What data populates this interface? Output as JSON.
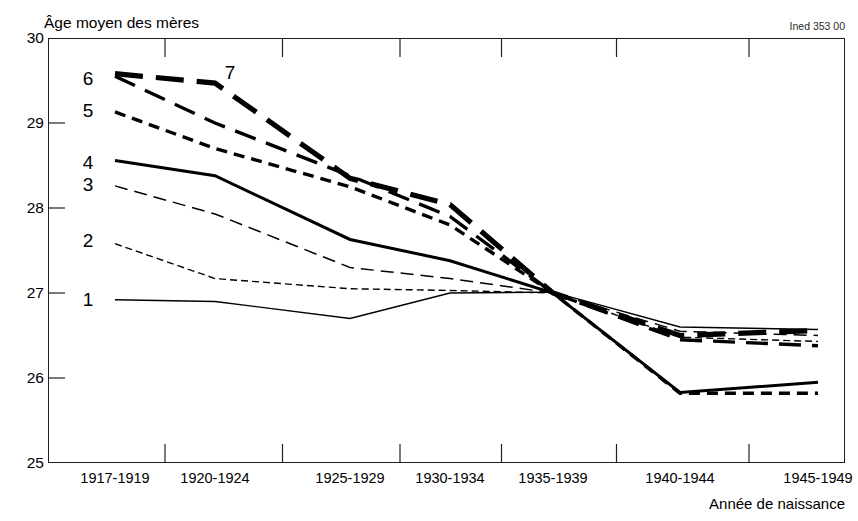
{
  "source_note": "Ined 353 00",
  "axis": {
    "y_title": "Âge moyen des mères",
    "x_title": "Année de naissance",
    "y_ticks": [
      "30",
      "29",
      "28",
      "27",
      "26",
      "25"
    ]
  },
  "series_labels": [
    "1",
    "2",
    "3",
    "4",
    "5",
    "6",
    "7"
  ],
  "chart_data": {
    "type": "line",
    "title": "Âge moyen des mères",
    "xlabel": "Année de naissance",
    "ylabel": "Âge moyen des mères",
    "ylim": [
      25,
      30
    ],
    "ytick_values": [
      25,
      26,
      27,
      28,
      29,
      30
    ],
    "grid": false,
    "legend": "inline-labels-at-left-of-each-curve",
    "annotations": [
      "Ined 353 00"
    ],
    "categories": [
      "1917-1919",
      "1920-1924",
      "1925-1929",
      "1930-1934",
      "1935-1939",
      "1940-1944",
      "1945-1949"
    ],
    "series": [
      {
        "name": "1",
        "label": "1",
        "style": "thin-solid",
        "values": [
          26.92,
          26.9,
          26.7,
          27.0,
          27.01,
          26.6,
          26.57
        ]
      },
      {
        "name": "2",
        "label": "2",
        "style": "fine-dotted",
        "values": [
          27.58,
          27.17,
          27.05,
          27.03,
          27.0,
          26.48,
          26.43
        ]
      },
      {
        "name": "3",
        "label": "3",
        "style": "thin-dashed",
        "values": [
          28.26,
          27.93,
          27.3,
          27.17,
          27.0,
          26.55,
          26.5
        ]
      },
      {
        "name": "4",
        "label": "4",
        "style": "medium-solid",
        "values": [
          28.56,
          28.38,
          27.63,
          27.38,
          27.0,
          25.83,
          25.95
        ]
      },
      {
        "name": "5",
        "label": "5",
        "style": "medium-dotted",
        "values": [
          29.13,
          28.7,
          28.25,
          27.8,
          27.0,
          25.82,
          25.82
        ]
      },
      {
        "name": "6",
        "label": "6",
        "style": "medium-dashed",
        "values": [
          29.55,
          29.0,
          28.38,
          27.9,
          27.0,
          26.45,
          26.38
        ]
      },
      {
        "name": "7",
        "label": "7",
        "style": "thick-dashed",
        "values": [
          29.58,
          29.47,
          28.35,
          28.04,
          27.0,
          26.5,
          26.56
        ]
      }
    ]
  }
}
